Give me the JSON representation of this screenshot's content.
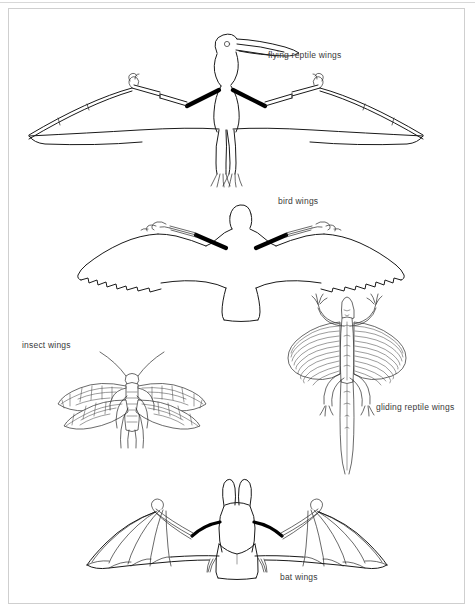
{
  "page": {
    "background_color": "#ffffff",
    "border_color": "#cfcfcf",
    "ink_color": "#1a1a1a",
    "label_color": "#3a3a3a"
  },
  "figures": [
    {
      "id": "flying-reptile",
      "label": "flying reptile wings",
      "subject": "pterosaur",
      "label_position": {
        "x": 268,
        "y": 50
      }
    },
    {
      "id": "bird",
      "label": "bird wings",
      "subject": "albatross",
      "label_position": {
        "x": 278,
        "y": 196
      }
    },
    {
      "id": "insect",
      "label": "insect wings",
      "subject": "lacewing",
      "label_position": {
        "x": 22,
        "y": 340
      }
    },
    {
      "id": "gliding-reptile",
      "label": "gliding reptile wings",
      "subject": "draco lizard",
      "label_position": {
        "x": 376,
        "y": 402
      }
    },
    {
      "id": "bat",
      "label": "bat wings",
      "subject": "bat",
      "label_position": {
        "x": 280,
        "y": 572
      }
    }
  ]
}
